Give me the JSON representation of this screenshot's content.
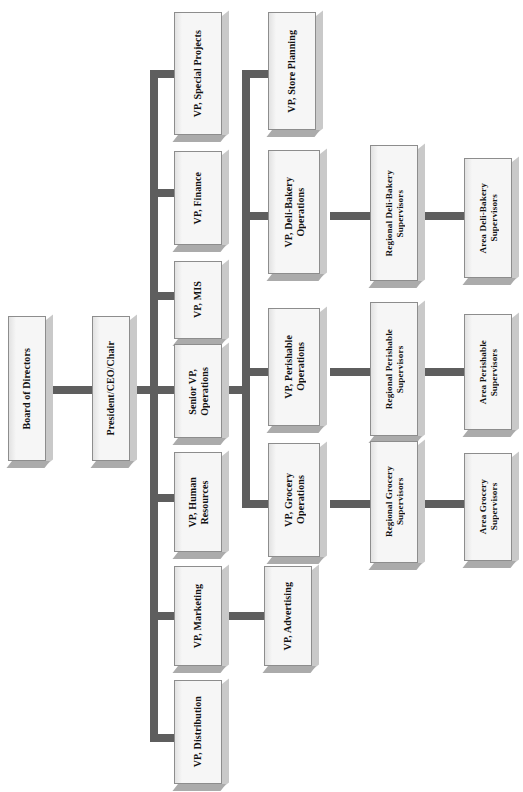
{
  "chart": {
    "orientation": "rotated-90",
    "box_fill_color": "#f2f2f2",
    "box_border_color": "#8d8d8d",
    "connector_color": "#5e5e5e",
    "background_color": "#ffffff"
  },
  "nodes": [
    {
      "id": "board",
      "label": "Board of Directors"
    },
    {
      "id": "president",
      "label": "President/CEO/Chair"
    },
    {
      "id": "vp_special",
      "label": "VP, Special Projects"
    },
    {
      "id": "vp_finance",
      "label": "VP, Finance"
    },
    {
      "id": "vp_mis",
      "label": "VP, MIS"
    },
    {
      "id": "svp_operations",
      "label": "Senior VP,\nOperations"
    },
    {
      "id": "vp_hr",
      "label": "VP, Human\nResources"
    },
    {
      "id": "vp_marketing",
      "label": "VP, Marketing"
    },
    {
      "id": "vp_distribution",
      "label": "VP, Distribution"
    },
    {
      "id": "vp_advertising",
      "label": "VP, Advertising"
    },
    {
      "id": "vp_store_planning",
      "label": "VP, Store Planning"
    },
    {
      "id": "vp_deli_bakery",
      "label": "VP, Deli-Bakery\nOperations"
    },
    {
      "id": "vp_perishable",
      "label": "VP, Perishable\nOperations"
    },
    {
      "id": "vp_grocery",
      "label": "VP, Grocery\nOperations"
    },
    {
      "id": "reg_deli",
      "label": "Regional Deli-Bakery\nSupervisors"
    },
    {
      "id": "reg_perishable",
      "label": "Regional Perishable\nSupervisors"
    },
    {
      "id": "reg_grocery",
      "label": "Regional Grocery\nSupervisors"
    },
    {
      "id": "area_deli",
      "label": "Area Deli-Bakery\nSupervisors"
    },
    {
      "id": "area_perishable",
      "label": "Area Perishable\nSupervisors"
    },
    {
      "id": "area_grocery",
      "label": "Area Grocery\nSupervisors"
    }
  ]
}
